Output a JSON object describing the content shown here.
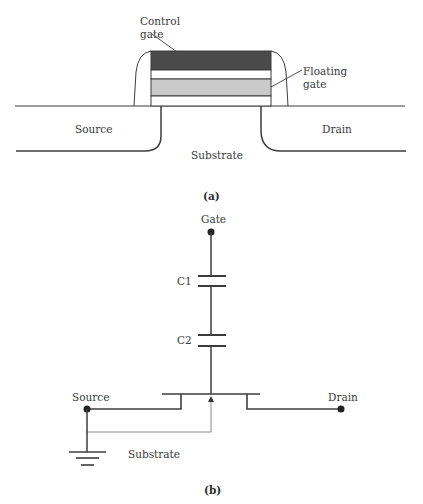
{
  "figure_a": {
    "caption": "(a)",
    "labels": {
      "control_gate_line1": "Control",
      "control_gate_line2": "gate",
      "floating_gate_line1": "Floating",
      "floating_gate_line2": "gate",
      "source": "Source",
      "drain": "Drain",
      "substrate": "Substrate"
    },
    "colors": {
      "control_gate": "#4a4a4a",
      "floating_gate": "#c9c9c9",
      "outline": "#3c3c3c"
    }
  },
  "figure_b": {
    "caption": "(b)",
    "labels": {
      "gate": "Gate",
      "c1": "C1",
      "c2": "C2",
      "source": "Source",
      "drain": "Drain",
      "substrate": "Substrate"
    }
  }
}
